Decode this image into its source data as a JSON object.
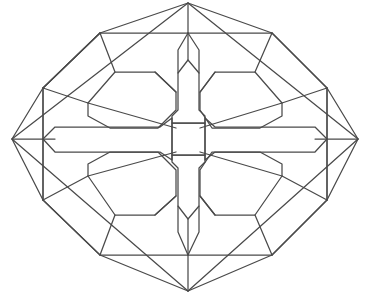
{
  "document": {
    "title": "Geometric Rosette Line Art",
    "kind": "line-drawing",
    "background_color": "#ffffff",
    "stroke_color": "#4a4a4a",
    "stroke_width": 1.25,
    "canvas": {
      "width": 371,
      "height": 295
    }
  },
  "figure": {
    "symmetry": "4-fold mirror (vertical and horizontal axes)",
    "center": {
      "x": 188,
      "y": 139
    },
    "shapes": [
      {
        "name": "outer-diamond-frame",
        "type": "polygon",
        "closed": true,
        "points": "188,3 358,139 188,291 12,139"
      },
      {
        "name": "inner-rosette-octagon",
        "type": "polygon",
        "closed": true,
        "points": "100,33 272,33 327,88 327,200 272,255 100,255 43,200 43,88"
      },
      {
        "name": "top-left-diagonal-chord",
        "type": "polyline",
        "closed": false,
        "points": "43,88 100,33"
      },
      {
        "name": "top-right-diagonal-chord",
        "type": "polyline",
        "closed": false,
        "points": "272,33 327,88"
      },
      {
        "name": "bottom-left-diagonal-chord",
        "type": "polyline",
        "closed": false,
        "points": "43,200 100,255"
      },
      {
        "name": "bottom-right-diagonal-chord",
        "type": "polyline",
        "closed": false,
        "points": "272,255 327,200"
      },
      {
        "name": "axis-line-top",
        "type": "polyline",
        "closed": false,
        "points": "188,3 188,60"
      },
      {
        "name": "axis-line-bottom",
        "type": "polyline",
        "closed": false,
        "points": "188,219 188,291"
      },
      {
        "name": "axis-line-left",
        "type": "polyline",
        "closed": false,
        "points": "12,139 55,139"
      },
      {
        "name": "axis-line-right",
        "type": "polyline",
        "closed": false,
        "points": "315,139 358,139"
      },
      {
        "name": "left-vertical-rib",
        "type": "polyline",
        "closed": false,
        "points": "43,88 43,200"
      },
      {
        "name": "right-vertical-rib",
        "type": "polyline",
        "closed": false,
        "points": "327,88 327,200"
      },
      {
        "name": "frame-fold-top-left",
        "type": "polyline",
        "closed": false,
        "points": "100,33 43,88"
      },
      {
        "name": "petal-upper-left",
        "type": "polygon",
        "closed": true,
        "points": "88,103 115,72 155,72 176,92 176,110 158,128 110,128 88,116"
      },
      {
        "name": "petal-upper-right",
        "type": "polygon",
        "closed": true,
        "points": "282,103 255,72 215,72 200,92 200,110 212,128 260,128 282,116"
      },
      {
        "name": "petal-lower-left",
        "type": "polygon",
        "closed": true,
        "points": "88,176 115,215 155,215 176,196 176,170 158,152 110,152 88,164"
      },
      {
        "name": "petal-lower-right",
        "type": "polygon",
        "closed": true,
        "points": "282,176 255,215 215,215 200,196 200,170 212,152 260,152 282,164"
      },
      {
        "name": "petal-chord-upper-left",
        "type": "polyline",
        "closed": false,
        "points": "88,103 176,128"
      },
      {
        "name": "petal-chord-upper-right",
        "type": "polyline",
        "closed": false,
        "points": "282,103 200,128"
      },
      {
        "name": "petal-chord-lower-left",
        "type": "polyline",
        "closed": false,
        "points": "88,176 176,152"
      },
      {
        "name": "petal-chord-lower-right",
        "type": "polyline",
        "closed": false,
        "points": "282,176 200,152"
      },
      {
        "name": "center-square",
        "type": "polygon",
        "closed": true,
        "points": "172,123 205,123 205,155 172,155"
      },
      {
        "name": "spear-top",
        "type": "polygon",
        "closed": true,
        "points": "188,60 199,73 199,110 205,116 205,123 172,123 172,116 178,110 178,73"
      },
      {
        "name": "spear-bottom",
        "type": "polygon",
        "closed": true,
        "points": "188,219 199,206 199,168 205,162 205,155 172,155 172,162 178,168 178,206"
      },
      {
        "name": "arm-left",
        "type": "polygon",
        "closed": true,
        "points": "55,127 160,127 172,118 172,160 160,152 55,152 43,139"
      },
      {
        "name": "arm-right",
        "type": "polygon",
        "closed": true,
        "points": "315,127 215,127 205,118 205,160 215,152 315,152 327,139"
      },
      {
        "name": "connector-upper-left-outer",
        "type": "polyline",
        "closed": false,
        "points": "43,88 88,103"
      },
      {
        "name": "connector-upper-right-outer",
        "type": "polyline",
        "closed": false,
        "points": "327,88 282,103"
      },
      {
        "name": "connector-lower-left-outer",
        "type": "polyline",
        "closed": false,
        "points": "43,200 88,176"
      },
      {
        "name": "connector-lower-right-outer",
        "type": "polyline",
        "closed": false,
        "points": "327,200 282,176"
      },
      {
        "name": "connector-top-center-left",
        "type": "polyline",
        "closed": false,
        "points": "188,33 178,50 178,73"
      },
      {
        "name": "connector-top-center-right",
        "type": "polyline",
        "closed": false,
        "points": "188,33 199,50 199,73"
      },
      {
        "name": "connector-bottom-center-left",
        "type": "polyline",
        "closed": false,
        "points": "188,255 178,232 178,206"
      },
      {
        "name": "connector-bottom-center-right",
        "type": "polyline",
        "closed": false,
        "points": "188,255 199,232 199,206"
      },
      {
        "name": "brace-upper-left-inner",
        "type": "polyline",
        "closed": false,
        "points": "176,92 155,72"
      },
      {
        "name": "brace-upper-right-inner",
        "type": "polyline",
        "closed": false,
        "points": "200,92 215,72"
      },
      {
        "name": "brace-lower-left-inner",
        "type": "polyline",
        "closed": false,
        "points": "176,196 155,215"
      },
      {
        "name": "brace-lower-right-inner",
        "type": "polyline",
        "closed": false,
        "points": "200,196 215,215"
      },
      {
        "name": "diamond-notch-left-upper",
        "type": "polyline",
        "closed": false,
        "points": "12,139 43,88"
      },
      {
        "name": "diamond-notch-left-lower",
        "type": "polyline",
        "closed": false,
        "points": "12,139 43,200"
      },
      {
        "name": "diamond-notch-right-upper",
        "type": "polyline",
        "closed": false,
        "points": "358,139 327,88"
      },
      {
        "name": "diamond-notch-right-lower",
        "type": "polyline",
        "closed": false,
        "points": "358,139 327,200"
      },
      {
        "name": "diamond-notch-top-left",
        "type": "polyline",
        "closed": false,
        "points": "188,3 100,33"
      },
      {
        "name": "diamond-notch-top-right",
        "type": "polyline",
        "closed": false,
        "points": "188,3 272,33"
      },
      {
        "name": "diamond-notch-bottom-left",
        "type": "polyline",
        "closed": false,
        "points": "188,291 100,255"
      },
      {
        "name": "diamond-notch-bottom-right",
        "type": "polyline",
        "closed": false,
        "points": "188,291 272,255"
      },
      {
        "name": "corner-fan-top-left",
        "type": "polyline",
        "closed": false,
        "points": "100,33 115,72"
      },
      {
        "name": "corner-fan-top-right",
        "type": "polyline",
        "closed": false,
        "points": "272,33 255,72"
      },
      {
        "name": "corner-fan-bottom-left",
        "type": "polyline",
        "closed": false,
        "points": "100,255 115,215"
      },
      {
        "name": "corner-fan-bottom-right",
        "type": "polyline",
        "closed": false,
        "points": "272,255 255,215"
      }
    ]
  }
}
